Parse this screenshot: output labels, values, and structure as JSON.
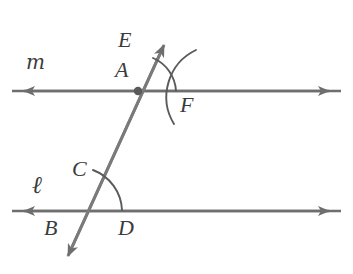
{
  "figure": {
    "type": "geometry-diagram",
    "background_color": "#ffffff",
    "stroke_color": "#6e6e6e",
    "label_color": "#3b3b3b",
    "width": 353,
    "height": 274
  },
  "lines": [
    {
      "name": "line-m",
      "label": "m",
      "label_x": 28,
      "label_y": 52,
      "kind": "double-arrow-horizontal",
      "x1": 12,
      "x2": 341,
      "y": 91
    },
    {
      "name": "line-l",
      "label": "ℓ",
      "label_x": 32,
      "label_y": 178,
      "kind": "double-arrow-horizontal",
      "x1": 12,
      "x2": 341,
      "y": 211
    },
    {
      "name": "transversal",
      "label": "",
      "kind": "double-arrow-oblique",
      "x1": 166,
      "y1": 41,
      "x2": 66,
      "y2": 260
    }
  ],
  "points": [
    {
      "name": "point-E",
      "label": "E",
      "x": 118,
      "y": 29
    },
    {
      "name": "point-A",
      "label": "A",
      "x": 115,
      "y": 58
    },
    {
      "name": "point-F",
      "label": "F",
      "x": 180,
      "y": 93
    },
    {
      "name": "point-C",
      "label": "C",
      "x": 72,
      "y": 158
    },
    {
      "name": "point-B",
      "label": "B",
      "x": 44,
      "y": 216
    },
    {
      "name": "point-D",
      "label": "D",
      "x": 118,
      "y": 216
    }
  ],
  "intersections": [
    {
      "name": "intersection-A",
      "x": 138,
      "y": 91,
      "marked": true
    },
    {
      "name": "intersection-B",
      "x": 84,
      "y": 211,
      "marked": false
    }
  ],
  "arcs": [
    {
      "name": "angle-arc-EAF",
      "from_label": "E",
      "to_label": "F",
      "description": "arc centered at intersection A from transversal toward line m on the right side"
    },
    {
      "name": "construction-arc-F",
      "from_label": "",
      "to_label": "F",
      "description": "second sweeping construction arc crossing near F"
    },
    {
      "name": "angle-arc-CD",
      "from_label": "C",
      "to_label": "D",
      "description": "arc from transversal at C sweeping to line l at D"
    }
  ]
}
